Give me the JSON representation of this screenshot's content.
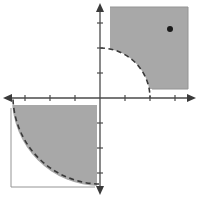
{
  "figure": {
    "name": "coordinate-plane-inequality-graph",
    "width": 199,
    "height": 198,
    "background_color": "#ffffff"
  },
  "axes": {
    "origin": {
      "x": 100,
      "y": 98
    },
    "axis_color": "#4a4a4a",
    "x_axis": {
      "label": "x-axis",
      "start_x": 4,
      "end_x": 195,
      "y": 98,
      "arrow_both_ends": true,
      "tick_spacing_px": 25,
      "tick_length_px": 5,
      "tick_positions_px": [
        25,
        50,
        75,
        125,
        150,
        175
      ],
      "tick_values": [
        -3,
        -2,
        -1,
        1,
        2,
        3
      ]
    },
    "y_axis": {
      "label": "y-axis",
      "start_y": 5,
      "end_y": 193,
      "x": 100,
      "arrow_both_ends": true,
      "tick_spacing_px": 25,
      "tick_length_px": 5,
      "tick_positions_px": [
        23,
        48,
        73,
        123,
        148,
        173
      ],
      "tick_values": [
        3,
        2,
        1,
        -1,
        -2,
        -3
      ]
    }
  },
  "chart_data": {
    "type": "scatter",
    "title": "",
    "xlabel": "",
    "ylabel": "",
    "xlim": [
      -4,
      4
    ],
    "ylim": [
      -4,
      4
    ],
    "grid": false,
    "legend": "none",
    "units_per_tick": 1,
    "pixels_per_unit": 25,
    "regions": [
      {
        "name": "quadrant-I-shaded-region",
        "quadrant": "I",
        "description": "Region in quadrant I outside the dashed arc of radius 2, bounded by the plot box",
        "boundary": "dashed-circular-arc",
        "boundary_style": "dashed",
        "boundary_radius_units": 2,
        "boundary_radius_px": 50,
        "arc_center_units": [
          0,
          0
        ],
        "fill_color": "#a8a8a8",
        "fill_opacity": 1,
        "box_px": {
          "left": 110,
          "top": 7,
          "right": 188,
          "bottom": 89
        }
      },
      {
        "name": "quadrant-III-shaded-region",
        "quadrant": "III",
        "description": "Region in quadrant III inside the dashed arc of radius 3.5, bounded by the plot box",
        "boundary": "dashed-circular-arc",
        "boundary_style": "dashed",
        "boundary_radius_units": 3.5,
        "boundary_radius_px": 88,
        "arc_center_units": [
          0,
          0
        ],
        "fill_color": "#a8a8a8",
        "fill_opacity": 1,
        "box_px": {
          "left": 11,
          "top": 108,
          "right": 97,
          "bottom": 187
        }
      }
    ],
    "points": [
      {
        "name": "test-point",
        "label": "",
        "x_units": 2.8,
        "y_units": 2.75,
        "px": {
          "x": 170,
          "y": 29
        },
        "color": "#1a1a1a",
        "radius_px": 3,
        "filled": true
      }
    ]
  },
  "colors": {
    "shade": "#a8a8a8",
    "shade_edge": "#949494",
    "axis": "#4a4a4a",
    "dash": "#3a3a3a",
    "point": "#1a1a1a",
    "background": "#ffffff"
  },
  "icons": {
    "arrow_left": "arrow-left-icon",
    "arrow_right": "arrow-right-icon",
    "arrow_up": "arrow-up-icon",
    "arrow_down": "arrow-down-icon"
  }
}
